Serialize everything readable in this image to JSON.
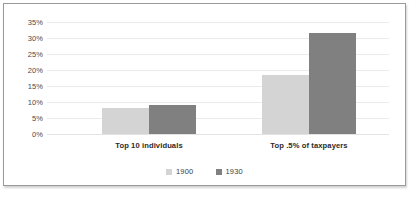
{
  "chart_data": {
    "type": "bar",
    "title": "",
    "xlabel": "",
    "ylabel": "",
    "ylim": [
      0,
      35
    ],
    "ytick_labels": [
      "35%",
      "30%",
      "25%",
      "20%",
      "15%",
      "10%",
      "5%",
      "0%"
    ],
    "ytick_values": [
      35,
      30,
      25,
      20,
      15,
      10,
      5,
      0
    ],
    "grid": true,
    "legend_position": "bottom-center",
    "categories": [
      "Top 10 individuals",
      "Top .5% of taxpayers"
    ],
    "series": [
      {
        "name": "1900",
        "color": "#d4d4d4",
        "values": [
          8,
          18.5
        ]
      },
      {
        "name": "1930",
        "color": "#808080",
        "values": [
          9,
          31.5
        ]
      }
    ]
  },
  "style": {
    "background": "#ffffff",
    "border_color": "#9a9a9a",
    "gridline_color": "#eceaea",
    "label_color": "#2b2b2b"
  }
}
